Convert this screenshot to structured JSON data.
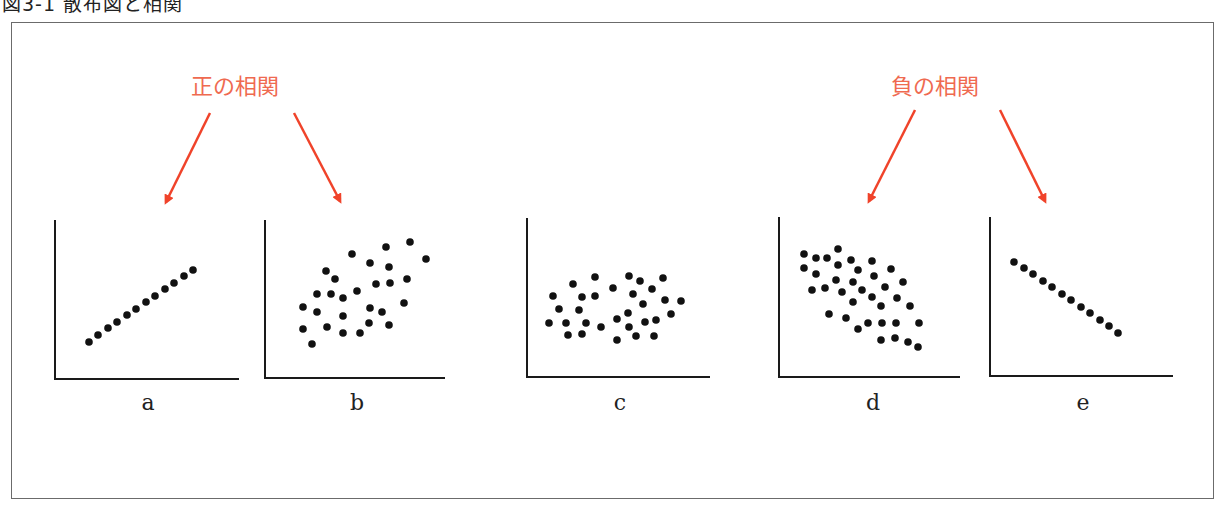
{
  "figure": {
    "title": "図3-1 散布図と相関",
    "positive_label": "正の相関",
    "negative_label": "負の相関",
    "accent_color": "#f0432a",
    "label_color": "#ef6a50"
  },
  "chart_data": {
    "type": "scatter",
    "title": "散布図と相関",
    "annotations": [
      {
        "text": "正の相関",
        "points_to": [
          "a",
          "b"
        ]
      },
      {
        "text": "負の相関",
        "points_to": [
          "d",
          "e"
        ]
      }
    ],
    "panels": [
      {
        "label": "a",
        "correlation": "strong positive",
        "points": [
          [
            89,
            342
          ],
          [
            98,
            335
          ],
          [
            108,
            328
          ],
          [
            117,
            322
          ],
          [
            127,
            315
          ],
          [
            136,
            309
          ],
          [
            146,
            302
          ],
          [
            155,
            296
          ],
          [
            165,
            289
          ],
          [
            174,
            283
          ],
          [
            184,
            276
          ],
          [
            193,
            270
          ]
        ]
      },
      {
        "label": "b",
        "correlation": "positive",
        "points": [
          [
            352,
            254
          ],
          [
            386,
            247
          ],
          [
            410,
            242
          ],
          [
            426,
            259
          ],
          [
            326,
            271
          ],
          [
            370,
            263
          ],
          [
            389,
            267
          ],
          [
            335,
            279
          ],
          [
            376,
            284
          ],
          [
            390,
            283
          ],
          [
            407,
            279
          ],
          [
            317,
            294
          ],
          [
            331,
            294
          ],
          [
            343,
            298
          ],
          [
            357,
            291
          ],
          [
            303,
            307
          ],
          [
            317,
            312
          ],
          [
            370,
            308
          ],
          [
            382,
            312
          ],
          [
            404,
            303
          ],
          [
            343,
            316
          ],
          [
            303,
            329
          ],
          [
            327,
            327
          ],
          [
            369,
            323
          ],
          [
            389,
            325
          ],
          [
            343,
            333
          ],
          [
            360,
            333
          ],
          [
            312,
            344
          ]
        ]
      },
      {
        "label": "c",
        "correlation": "none",
        "points": [
          [
            595,
            277
          ],
          [
            629,
            276
          ],
          [
            663,
            278
          ],
          [
            573,
            284
          ],
          [
            640,
            281
          ],
          [
            613,
            288
          ],
          [
            652,
            289
          ],
          [
            553,
            296
          ],
          [
            582,
            297
          ],
          [
            595,
            296
          ],
          [
            633,
            294
          ],
          [
            665,
            300
          ],
          [
            681,
            301
          ],
          [
            643,
            304
          ],
          [
            559,
            309
          ],
          [
            579,
            310
          ],
          [
            628,
            313
          ],
          [
            671,
            314
          ],
          [
            549,
            323
          ],
          [
            566,
            323
          ],
          [
            586,
            323
          ],
          [
            617,
            319
          ],
          [
            601,
            327
          ],
          [
            629,
            327
          ],
          [
            645,
            322
          ],
          [
            656,
            320
          ],
          [
            568,
            335
          ],
          [
            582,
            334
          ],
          [
            636,
            336
          ],
          [
            654,
            336
          ],
          [
            617,
            340
          ]
        ]
      },
      {
        "label": "d",
        "correlation": "negative",
        "points": [
          [
            804,
            254
          ],
          [
            816,
            258
          ],
          [
            827,
            258
          ],
          [
            838,
            249
          ],
          [
            851,
            260
          ],
          [
            872,
            261
          ],
          [
            804,
            268
          ],
          [
            838,
            265
          ],
          [
            858,
            270
          ],
          [
            891,
            269
          ],
          [
            816,
            274
          ],
          [
            874,
            276
          ],
          [
            836,
            280
          ],
          [
            853,
            282
          ],
          [
            903,
            282
          ],
          [
            812,
            290
          ],
          [
            825,
            288
          ],
          [
            842,
            292
          ],
          [
            862,
            290
          ],
          [
            885,
            287
          ],
          [
            872,
            297
          ],
          [
            897,
            298
          ],
          [
            853,
            302
          ],
          [
            881,
            306
          ],
          [
            910,
            306
          ],
          [
            829,
            314
          ],
          [
            846,
            318
          ],
          [
            868,
            323
          ],
          [
            882,
            323
          ],
          [
            896,
            323
          ],
          [
            919,
            323
          ],
          [
            858,
            329
          ],
          [
            881,
            340
          ],
          [
            895,
            338
          ],
          [
            908,
            342
          ],
          [
            918,
            347
          ]
        ]
      },
      {
        "label": "e",
        "correlation": "strong negative",
        "points": [
          [
            1014,
            262
          ],
          [
            1024,
            268
          ],
          [
            1033,
            274
          ],
          [
            1043,
            281
          ],
          [
            1052,
            287
          ],
          [
            1062,
            294
          ],
          [
            1071,
            300
          ],
          [
            1081,
            307
          ],
          [
            1090,
            313
          ],
          [
            1100,
            320
          ],
          [
            1109,
            326
          ],
          [
            1118,
            333
          ]
        ]
      }
    ],
    "axes": [
      {
        "panel": "a",
        "x0": 55,
        "y_top": 220,
        "y0": 379,
        "x_end": 239
      },
      {
        "panel": "b",
        "x0": 265,
        "y_top": 220,
        "y0": 378,
        "x_end": 445
      },
      {
        "panel": "c",
        "x0": 527,
        "y_top": 218,
        "y0": 377,
        "x_end": 710
      },
      {
        "panel": "d",
        "x0": 779,
        "y_top": 217,
        "y0": 377,
        "x_end": 960
      },
      {
        "panel": "e",
        "x0": 990,
        "y_top": 217,
        "y0": 376,
        "x_end": 1173
      }
    ],
    "panel_label_positions": [
      [
        148,
        410
      ],
      [
        357,
        410
      ],
      [
        620,
        410
      ],
      [
        873,
        410
      ],
      [
        1083,
        410
      ]
    ],
    "xlabel": "",
    "ylabel": "",
    "grid": false
  }
}
